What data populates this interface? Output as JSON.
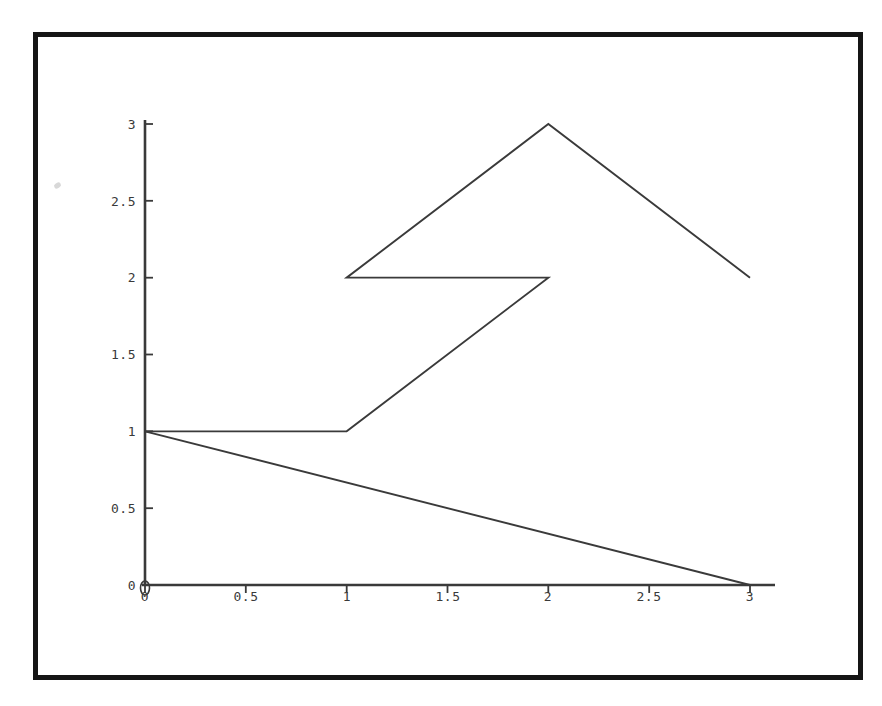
{
  "document": {
    "type": "scanned-plot-figure",
    "background_color": "#ffffff",
    "border_color": "#151515",
    "ink_color": "#3a3a3a"
  },
  "chart_data": {
    "type": "line",
    "title": "",
    "xlabel": "",
    "ylabel": "",
    "xlim": [
      0,
      3
    ],
    "ylim": [
      0,
      3
    ],
    "grid": false,
    "legend": null,
    "xticks": [
      0,
      0.5,
      1,
      1.5,
      2,
      2.5,
      3
    ],
    "yticks": [
      0,
      0.5,
      1,
      1.5,
      2,
      2.5,
      3
    ],
    "xtick_labels": [
      "0",
      "0.5",
      "1",
      "1.5",
      "2",
      "2.5",
      "3"
    ],
    "ytick_labels": [
      "0",
      "0.5",
      "1",
      "1.5",
      "2",
      "2.5",
      "3"
    ],
    "series": [
      {
        "name": "zigzag-polyline",
        "points": [
          [
            0,
            1
          ],
          [
            1,
            1
          ],
          [
            2,
            2
          ],
          [
            1,
            2
          ],
          [
            2,
            3
          ],
          [
            3,
            2
          ]
        ]
      },
      {
        "name": "descending-line",
        "points": [
          [
            0,
            1
          ],
          [
            3,
            0
          ]
        ]
      }
    ]
  },
  "axes": {
    "x_axis_name": "x-axis",
    "y_axis_name": "y-axis",
    "origin_label": "0"
  }
}
